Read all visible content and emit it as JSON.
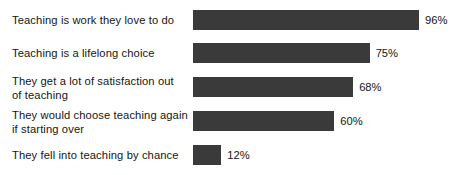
{
  "chart_data": {
    "type": "bar",
    "orientation": "horizontal",
    "title": "",
    "subtitle": "",
    "xlabel": "",
    "ylabel": "",
    "xlim": [
      0,
      100
    ],
    "grid": false,
    "legend": null,
    "value_suffix": "%",
    "categories": [
      "Teaching is work they love to do",
      "Teaching is a lifelong choice",
      "They get a lot of satisfaction out of teaching",
      "They would choose teaching again if starting over",
      "They fell into teaching by chance"
    ],
    "values": [
      96,
      75,
      68,
      60,
      12
    ],
    "value_labels": [
      "96%",
      "75%",
      "68%",
      "60%",
      "12%"
    ],
    "bars": [
      {
        "label_line1": "Teaching is work they love to do",
        "label_line2": "",
        "value": 96,
        "value_label": "96%"
      },
      {
        "label_line1": "Teaching is a lifelong choice",
        "label_line2": "",
        "value": 75,
        "value_label": "75%"
      },
      {
        "label_line1": "They get a lot of satisfaction out",
        "label_line2": "of teaching",
        "value": 68,
        "value_label": "68%"
      },
      {
        "label_line1": "They would choose teaching again",
        "label_line2": "if starting over",
        "value": 60,
        "value_label": "60%"
      },
      {
        "label_line1": "They fell into teaching by chance",
        "label_line2": "",
        "value": 12,
        "value_label": "12%"
      }
    ]
  },
  "colors": {
    "bar": "#3a3a3a",
    "text": "#151515",
    "background": "#ffffff"
  }
}
